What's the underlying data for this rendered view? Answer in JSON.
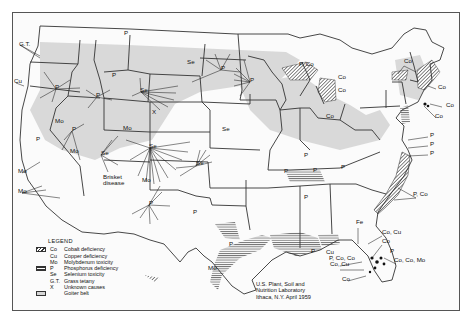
{
  "map": {
    "subject": "Geographic distribution of trace element problems in livestock, United States",
    "legend": {
      "title": "LEGEND",
      "items": [
        {
          "symbol": "Co",
          "label": "Cobalt deficiency",
          "swatch": "diagonal-hatch"
        },
        {
          "symbol": "Cu",
          "label": "Copper deficiency",
          "swatch": ""
        },
        {
          "symbol": "Mo",
          "label": "Molybdenum toxicity",
          "swatch": ""
        },
        {
          "symbol": "P",
          "label": "Phosphorus deficiency",
          "swatch": "horizontal-hatch"
        },
        {
          "symbol": "Se",
          "label": "Selenium toxicity",
          "swatch": ""
        },
        {
          "symbol": "G.T.",
          "label": "Grass tetany",
          "swatch": ""
        },
        {
          "symbol": "X",
          "label": "Unknown causes",
          "swatch": ""
        },
        {
          "symbol": "",
          "label": "Goiter belt",
          "swatch": "gray-fill"
        }
      ]
    },
    "credit": {
      "line1": "U.S. Plant, Soil and",
      "line2": "Nutrition Laboratory",
      "line3": "Ithaca, N.Y.  April 1959"
    },
    "annotations": [
      {
        "text": "G.T.",
        "x": 19,
        "y": 46
      },
      {
        "text": "Cu",
        "x": 14,
        "y": 83
      },
      {
        "text": "P",
        "x": 55,
        "y": 89
      },
      {
        "text": "P",
        "x": 124,
        "y": 35
      },
      {
        "text": "P",
        "x": 112,
        "y": 77
      },
      {
        "text": "P",
        "x": 96,
        "y": 97
      },
      {
        "text": "Se",
        "x": 140,
        "y": 92
      },
      {
        "text": "Se",
        "x": 187,
        "y": 64
      },
      {
        "text": "P",
        "x": 221,
        "y": 70
      },
      {
        "text": "P",
        "x": 250,
        "y": 82
      },
      {
        "text": "X",
        "x": 152,
        "y": 114
      },
      {
        "text": "Mo",
        "x": 55,
        "y": 123
      },
      {
        "text": "P",
        "x": 72,
        "y": 131
      },
      {
        "text": "P",
        "x": 36,
        "y": 141
      },
      {
        "text": "Mo",
        "x": 70,
        "y": 153
      },
      {
        "text": "Mo",
        "x": 123,
        "y": 130
      },
      {
        "text": "Se",
        "x": 101,
        "y": 155
      },
      {
        "text": "Se",
        "x": 149,
        "y": 148
      },
      {
        "text": "Se",
        "x": 196,
        "y": 165
      },
      {
        "text": "Se",
        "x": 222,
        "y": 131
      },
      {
        "text": "Brisket",
        "x": 103,
        "y": 179
      },
      {
        "text": "disease",
        "x": 103,
        "y": 185
      },
      {
        "text": "Mo",
        "x": 18,
        "y": 173
      },
      {
        "text": "Mo",
        "x": 18,
        "y": 193
      },
      {
        "text": "Mo",
        "x": 142,
        "y": 182
      },
      {
        "text": "P",
        "x": 149,
        "y": 205
      },
      {
        "text": "P",
        "x": 193,
        "y": 214
      },
      {
        "text": "P",
        "x": 229,
        "y": 246
      },
      {
        "text": "Mo",
        "x": 208,
        "y": 270
      },
      {
        "text": "P, Co",
        "x": 299,
        "y": 66
      },
      {
        "text": "Co",
        "x": 338,
        "y": 79
      },
      {
        "text": "Co",
        "x": 338,
        "y": 92
      },
      {
        "text": "Co",
        "x": 326,
        "y": 118
      },
      {
        "text": "Co",
        "x": 404,
        "y": 63
      },
      {
        "text": "Co",
        "x": 438,
        "y": 89
      },
      {
        "text": "Co",
        "x": 446,
        "y": 107
      },
      {
        "text": "Co",
        "x": 435,
        "y": 118
      },
      {
        "text": "P",
        "x": 284,
        "y": 173
      },
      {
        "text": "P",
        "x": 313,
        "y": 172
      },
      {
        "text": "P",
        "x": 341,
        "y": 169
      },
      {
        "text": "P",
        "x": 304,
        "y": 157
      },
      {
        "text": "P",
        "x": 304,
        "y": 199
      },
      {
        "text": "P",
        "x": 430,
        "y": 137
      },
      {
        "text": "P",
        "x": 430,
        "y": 146
      },
      {
        "text": "P",
        "x": 430,
        "y": 155
      },
      {
        "text": "P, Co",
        "x": 413,
        "y": 196
      },
      {
        "text": "Fe",
        "x": 356,
        "y": 224
      },
      {
        "text": "Co, Cu",
        "x": 382,
        "y": 234
      },
      {
        "text": "Co",
        "x": 382,
        "y": 243
      },
      {
        "text": "P",
        "x": 390,
        "y": 253
      },
      {
        "text": "Co, Cu",
        "x": 330,
        "y": 266
      },
      {
        "text": "P, Co, Co",
        "x": 329,
        "y": 260
      },
      {
        "text": "Co",
        "x": 342,
        "y": 281
      },
      {
        "text": "Co, Co, Mo",
        "x": 394,
        "y": 262
      },
      {
        "text": "P",
        "x": 311,
        "y": 253
      },
      {
        "text": "Cu",
        "x": 326,
        "y": 254
      }
    ]
  }
}
